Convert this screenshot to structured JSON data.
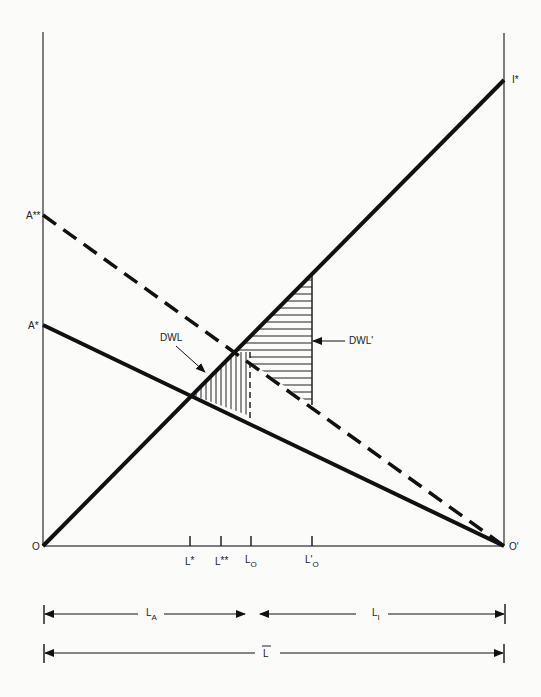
{
  "diagram": {
    "type": "economic box diagram (labor allocation / deadweight loss)",
    "axes": {
      "origin_left": "O",
      "origin_right": "O'",
      "left_axis_points": [
        "A**",
        "A*"
      ],
      "right_axis_points": [
        "I*"
      ]
    },
    "curves": [
      {
        "name": "O to I*",
        "style": "solid-thick",
        "from": "O",
        "to": "I*"
      },
      {
        "name": "A* to O'",
        "style": "solid-thick",
        "from": "A*",
        "to": "O'"
      },
      {
        "name": "A** to O'",
        "style": "dashed-thick",
        "from": "A**",
        "to": "O'"
      }
    ],
    "ticks": [
      {
        "label": "L*",
        "base": "L",
        "sup": "*"
      },
      {
        "label": "L**",
        "base": "L",
        "sup": "**"
      },
      {
        "label": "L_O",
        "base": "L",
        "sub": "O"
      },
      {
        "label": "L'_O",
        "base": "L'",
        "sub": "O"
      }
    ],
    "regions": [
      {
        "label": "DWL",
        "hatch": "vertical"
      },
      {
        "label": "DWL'",
        "hatch": "horizontal"
      }
    ],
    "spans": [
      {
        "label": "L_A",
        "base": "L",
        "sub": "A"
      },
      {
        "label": "L_I",
        "base": "L",
        "sub": "I"
      },
      {
        "label": "L-bar",
        "base": "L",
        "overline": true
      }
    ]
  },
  "labels": {
    "O": "O",
    "O_prime": "O'",
    "A_double_star": "A**",
    "A_star": "A*",
    "I_star": "I*",
    "DWL": "DWL",
    "DWL_prime": "DWL'",
    "L": "L",
    "L_prime": "L'",
    "sup_star": "*",
    "sup_double_star": "**",
    "sub_O": "O",
    "sub_A": "A",
    "sub_I": "I"
  },
  "colors": {
    "ink": "#111111",
    "axis": "#555555",
    "background": "#fbfbfa"
  }
}
